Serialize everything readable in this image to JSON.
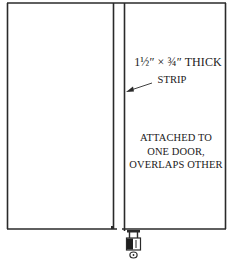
{
  "diagram": {
    "labels": {
      "dimension_prefix": "1½″ × ¾″ THICK",
      "strip": "STRIP",
      "attached_line1": "ATTACHED TO",
      "attached_line2": "ONE DOOR,",
      "attached_line3": "OVERLAPS OTHER"
    },
    "colors": {
      "line": "#2a2a2a",
      "background": "#ffffff"
    }
  }
}
